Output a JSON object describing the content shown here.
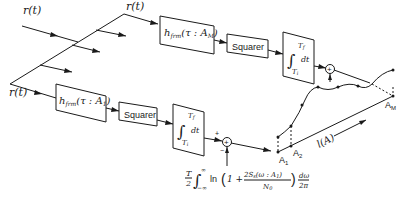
{
  "diagram": {
    "inputs": {
      "top_label": "r(t)",
      "middle_label": "r(t)",
      "bottom_label": "r(t)"
    },
    "branch_top": {
      "filter_label": "h",
      "filter_sub": "frm",
      "filter_arg": "(τ : A",
      "filter_arg_sub": "M",
      "filter_close": ")",
      "squarer_label": "Squarer",
      "integrator_upper": "T",
      "integrator_upper_sub": "f",
      "integrator_lower": "T",
      "integrator_lower_sub": "i",
      "integrator_dt": "dt",
      "summer_symbol": "+"
    },
    "branch_bottom": {
      "filter_label": "h",
      "filter_sub": "frm",
      "filter_arg": "(τ : A",
      "filter_arg_sub": "1",
      "filter_close": ")",
      "squarer_label": "Squarer",
      "integrator_upper": "T",
      "integrator_upper_sub": "f",
      "integrator_lower": "T",
      "integrator_lower_sub": "i",
      "integrator_dt": "dt",
      "summer_symbol": "+",
      "plus_sign": "+",
      "minus_sign": "−"
    },
    "bias_term": {
      "prefix_num": "T",
      "prefix_den": "2",
      "integral_upper": "∞",
      "integral_lower": "−∞",
      "ln": "ln",
      "open": "(",
      "one_plus": "1 +",
      "frac_num": "2S",
      "frac_num_sub": "s",
      "frac_num_arg": "(ω : A",
      "frac_num_arg_sub": "1",
      "frac_num_close": ")",
      "frac_den": "N",
      "frac_den_sub": "0",
      "close": ")",
      "dw_num": "dω",
      "dw_den": "2π"
    },
    "plot": {
      "point_labels": [
        "A",
        "A",
        "A"
      ],
      "point_subs": [
        "1",
        "2",
        "M"
      ],
      "axis_label": "l(A)"
    }
  }
}
